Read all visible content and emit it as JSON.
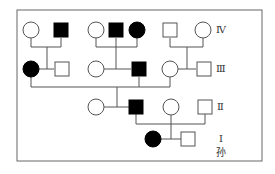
{
  "diagram": {
    "type": "pedigree",
    "colors": {
      "line": "#555555",
      "affected": "#000000",
      "unaffected": "#ffffff",
      "frame": "#666666"
    },
    "frame": {
      "x": 17,
      "y": 10,
      "w": 245,
      "h": 151
    },
    "generation_labels": [
      {
        "text": "Ⅳ",
        "x": 216,
        "y": 25
      },
      {
        "text": "Ⅲ",
        "x": 216,
        "y": 64
      },
      {
        "text": "Ⅱ",
        "x": 217,
        "y": 102
      },
      {
        "text": "Ⅰ",
        "x": 219,
        "y": 134
      },
      {
        "text": "孙",
        "x": 216,
        "y": 148
      }
    ],
    "individuals": [
      {
        "id": "IV-1",
        "sex": "female",
        "affected": false,
        "x": 31,
        "y": 30
      },
      {
        "id": "IV-2",
        "sex": "male",
        "affected": true,
        "x": 61,
        "y": 30
      },
      {
        "id": "IV-3",
        "sex": "female",
        "affected": false,
        "x": 96,
        "y": 30
      },
      {
        "id": "IV-4",
        "sex": "male",
        "affected": true,
        "x": 116,
        "y": 30
      },
      {
        "id": "IV-5",
        "sex": "female",
        "affected": true,
        "x": 137,
        "y": 30
      },
      {
        "id": "IV-6",
        "sex": "male",
        "affected": false,
        "x": 170,
        "y": 30
      },
      {
        "id": "IV-7",
        "sex": "female",
        "affected": false,
        "x": 203,
        "y": 30
      },
      {
        "id": "III-1",
        "sex": "female",
        "affected": true,
        "x": 31,
        "y": 69
      },
      {
        "id": "III-2",
        "sex": "male",
        "affected": false,
        "x": 62,
        "y": 69
      },
      {
        "id": "III-3",
        "sex": "female",
        "affected": false,
        "x": 96,
        "y": 69
      },
      {
        "id": "III-4",
        "sex": "male",
        "affected": true,
        "x": 139,
        "y": 69
      },
      {
        "id": "III-5",
        "sex": "female",
        "affected": false,
        "x": 170,
        "y": 69
      },
      {
        "id": "III-6",
        "sex": "male",
        "affected": false,
        "x": 204,
        "y": 69
      },
      {
        "id": "II-1",
        "sex": "female",
        "affected": false,
        "x": 96,
        "y": 107
      },
      {
        "id": "II-2",
        "sex": "male",
        "affected": true,
        "x": 136,
        "y": 107
      },
      {
        "id": "II-3",
        "sex": "female",
        "affected": false,
        "x": 171,
        "y": 107
      },
      {
        "id": "II-4",
        "sex": "male",
        "affected": false,
        "x": 205,
        "y": 107
      },
      {
        "id": "I-1",
        "sex": "female",
        "affected": true,
        "x": 153,
        "y": 139
      },
      {
        "id": "I-2",
        "sex": "male",
        "affected": false,
        "x": 188,
        "y": 139
      }
    ],
    "lines": [
      [
        31,
        38,
        31,
        47
      ],
      [
        61,
        38,
        61,
        47
      ],
      [
        31,
        47,
        61,
        47
      ],
      [
        47,
        47,
        47,
        69
      ],
      [
        39,
        69,
        54,
        69
      ],
      [
        96,
        38,
        96,
        47
      ],
      [
        137,
        38,
        137,
        47
      ],
      [
        96,
        47,
        137,
        47
      ],
      [
        116,
        38,
        116,
        69
      ],
      [
        104,
        69,
        131,
        69
      ],
      [
        170,
        38,
        170,
        47
      ],
      [
        203,
        38,
        203,
        47
      ],
      [
        170,
        47,
        203,
        47
      ],
      [
        187,
        47,
        187,
        69
      ],
      [
        178,
        69,
        196,
        69
      ],
      [
        31,
        77,
        31,
        87
      ],
      [
        139,
        77,
        139,
        87
      ],
      [
        170,
        77,
        170,
        87
      ],
      [
        31,
        87,
        170,
        87
      ],
      [
        117,
        87,
        117,
        107
      ],
      [
        104,
        107,
        130,
        107
      ],
      [
        136,
        114,
        136,
        124
      ],
      [
        205,
        114,
        205,
        124
      ],
      [
        136,
        124,
        205,
        124
      ],
      [
        171,
        115,
        171,
        139
      ],
      [
        161,
        139,
        182,
        139
      ]
    ],
    "symbol_size": 16
  }
}
